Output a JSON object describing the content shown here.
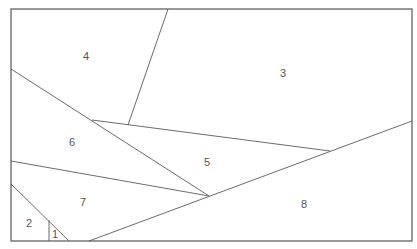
{
  "diagram": {
    "type": "planar-partition",
    "frame": {
      "x": 11,
      "y": 9,
      "width": 401,
      "height": 232
    },
    "edges": [
      {
        "id": "e-top-split",
        "x1": 168,
        "y1": 9,
        "x2": 128,
        "y2": 125
      },
      {
        "id": "e-left-diag",
        "x1": 11,
        "y1": 69,
        "x2": 209,
        "y2": 196
      },
      {
        "id": "e-mid-upper",
        "x1": 92,
        "y1": 120,
        "x2": 330,
        "y2": 151
      },
      {
        "id": "e-left-mid",
        "x1": 11,
        "y1": 161,
        "x2": 209,
        "y2": 196
      },
      {
        "id": "e-long-rise",
        "x1": 89,
        "y1": 241,
        "x2": 412,
        "y2": 121
      },
      {
        "id": "e-bottom-left-diag",
        "x1": 11,
        "y1": 184,
        "x2": 69,
        "y2": 241
      },
      {
        "id": "e-small-vertical",
        "x1": 49,
        "y1": 220,
        "x2": 49,
        "y2": 241
      }
    ],
    "regions": [
      {
        "label": "1",
        "x": 55,
        "y": 235
      },
      {
        "label": "2",
        "x": 29,
        "y": 224
      },
      {
        "label": "3",
        "x": 283,
        "y": 74
      },
      {
        "label": "4",
        "x": 86,
        "y": 57
      },
      {
        "label": "5",
        "x": 207,
        "y": 163
      },
      {
        "label": "6",
        "x": 72,
        "y": 143
      },
      {
        "label": "7",
        "x": 83,
        "y": 203
      },
      {
        "label": "8",
        "x": 304,
        "y": 205
      }
    ]
  }
}
